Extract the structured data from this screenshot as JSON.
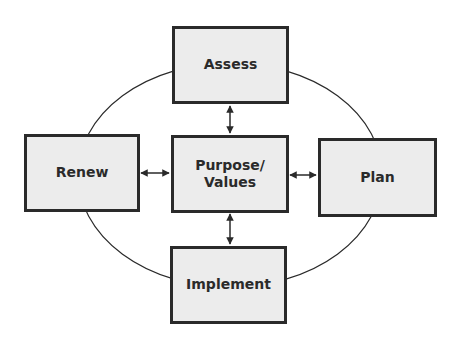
{
  "diagram": {
    "type": "cycle",
    "center": {
      "label_line1": "Purpose/",
      "label_line2": "Values"
    },
    "nodes": [
      {
        "id": "assess",
        "label": "Assess"
      },
      {
        "id": "plan",
        "label": "Plan"
      },
      {
        "id": "implement",
        "label": "Implement"
      },
      {
        "id": "renew",
        "label": "Renew"
      }
    ],
    "connections": [
      {
        "from": "center",
        "to": "assess",
        "style": "double-arrow"
      },
      {
        "from": "center",
        "to": "plan",
        "style": "double-arrow"
      },
      {
        "from": "center",
        "to": "implement",
        "style": "double-arrow"
      },
      {
        "from": "center",
        "to": "renew",
        "style": "double-arrow"
      }
    ],
    "colors": {
      "border": "#2a2a2a",
      "fill": "#ececec",
      "line": "#2a2a2a"
    }
  }
}
